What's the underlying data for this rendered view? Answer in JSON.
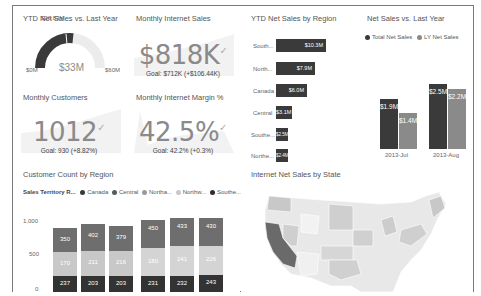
{
  "tiles": {
    "ytd_gauge": {
      "title": "YTD Net Sales vs. Last Year",
      "value": "$33M",
      "target": "$26.83M",
      "min": "$0M",
      "max": "$60M"
    },
    "monthly_internet_sales": {
      "title": "Monthly Internet Sales",
      "value": "$818K",
      "goal": "Goal: $712K (+$106.44K)"
    },
    "ytd_by_region": {
      "title": "YTD Net Sales by Region",
      "bars": [
        {
          "label": "South...",
          "value": "$10.3M",
          "width": 76
        },
        {
          "label": "North...",
          "value": "$7.9M",
          "width": 60
        },
        {
          "label": "Canada",
          "value": "$6.0M",
          "width": 46
        },
        {
          "label": "Central",
          "value": "$3.1M",
          "width": 16
        },
        {
          "label": "Southe...",
          "value": "$2.5M",
          "width": 12
        },
        {
          "label": "Northe...",
          "value": "$2.4M",
          "width": 12
        }
      ]
    },
    "net_vs_ly": {
      "title": "Net Sales vs. Last Year",
      "legend": [
        {
          "label": "Total Net Sales",
          "color": "#3a3a3a"
        },
        {
          "label": "LY Net Sales",
          "color": "#8a8a8a"
        }
      ],
      "categories": [
        "2013-Jul",
        "2013-Aug"
      ],
      "series": [
        {
          "name": "Total Net Sales",
          "values": [
            "$1.9M",
            "$2.5M"
          ],
          "heights": [
            50,
            66
          ]
        },
        {
          "name": "LY Net Sales",
          "values": [
            "$1.4M",
            "$2.2M"
          ],
          "heights": [
            36,
            58
          ]
        }
      ]
    },
    "monthly_customers": {
      "title": "Monthly Customers",
      "value": "1012",
      "goal": "Goal: 930 (+8.82%)"
    },
    "monthly_margin": {
      "title": "Monthly Internet Margin %",
      "value": "42.5%",
      "goal": "Goal: 42.2% (+0.3%)"
    },
    "customer_count": {
      "title": "Customer Count by Region",
      "legend_title": "Sales Territory R...",
      "legend": [
        {
          "label": "Canada",
          "color": "#3a3a3a"
        },
        {
          "label": "Central",
          "color": "#5a5a5a"
        },
        {
          "label": "Northa...",
          "color": "#9a9a9a"
        },
        {
          "label": "Northw...",
          "color": "#c8c8c8"
        },
        {
          "label": "Southe...",
          "color": "#2e2e2e"
        }
      ],
      "y_ticks": [
        "1,000",
        "500",
        "0"
      ],
      "columns": [
        {
          "top": "350",
          "mid": "170",
          "bottom": "237"
        },
        {
          "top": "402",
          "mid": "211",
          "bottom": "203"
        },
        {
          "top": "379",
          "mid": "216",
          "bottom": "203"
        },
        {
          "top": "450",
          "mid": "180",
          "bottom": "231"
        },
        {
          "top": "433",
          "mid": "241",
          "bottom": "232"
        },
        {
          "top": "430",
          "mid": "226",
          "bottom": "243"
        }
      ]
    },
    "map": {
      "title": "Internet Net Sales by State"
    }
  }
}
